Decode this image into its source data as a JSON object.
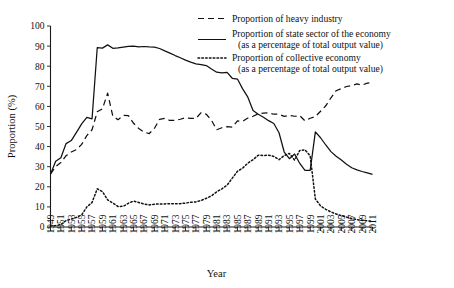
{
  "chart_data": {
    "type": "line",
    "title": "",
    "xlabel": "Year",
    "ylabel": "Proportion (%)",
    "xlim": [
      1949,
      2011
    ],
    "ylim": [
      0,
      100
    ],
    "grid": false,
    "legend_position": "top-right",
    "y_ticks": [
      0,
      10,
      20,
      30,
      40,
      50,
      60,
      70,
      80,
      90,
      100
    ],
    "x_ticks": [
      1949,
      1951,
      1953,
      1955,
      1957,
      1959,
      1961,
      1963,
      1965,
      1967,
      1969,
      1971,
      1973,
      1975,
      1977,
      1979,
      1981,
      1983,
      1985,
      1987,
      1989,
      1991,
      1993,
      1995,
      1997,
      1999,
      2001,
      2003,
      2005,
      2007,
      2009,
      2011
    ],
    "x": [
      1949,
      1950,
      1951,
      1952,
      1953,
      1954,
      1955,
      1956,
      1957,
      1958,
      1959,
      1960,
      1961,
      1962,
      1963,
      1964,
      1965,
      1966,
      1967,
      1968,
      1969,
      1970,
      1971,
      1972,
      1973,
      1974,
      1975,
      1976,
      1977,
      1978,
      1979,
      1980,
      1981,
      1982,
      1983,
      1984,
      1985,
      1986,
      1987,
      1988,
      1989,
      1990,
      1991,
      1992,
      1993,
      1994,
      1995,
      1996,
      1997,
      1998,
      1999,
      2000,
      2001,
      2002,
      2003,
      2004,
      2005,
      2006,
      2007,
      2008,
      2009,
      2010,
      2011
    ],
    "series": [
      {
        "name": "Proportion of heavy industry",
        "style": "dashed",
        "values": [
          26.4,
          30.1,
          32.1,
          35.5,
          37.3,
          38.5,
          41.1,
          45.5,
          48.4,
          57.3,
          58.8,
          66.6,
          55.1,
          53.4,
          55.5,
          55.4,
          51.6,
          49.0,
          47.2,
          46.5,
          49.0,
          53.6,
          54.0,
          53.0,
          53.1,
          53.6,
          54.4,
          54.0,
          54.0,
          56.9,
          56.1,
          53.1,
          48.4,
          49.4,
          49.9,
          49.7,
          52.8,
          52.6,
          54.2,
          55.1,
          56.3,
          56.6,
          56.8,
          56.1,
          56.1,
          55.0,
          55.5,
          55.1,
          55.4,
          52.8,
          54.1,
          54.9,
          57.6,
          60.3,
          64.3,
          67.8,
          68.9,
          69.9,
          70.4,
          71.2,
          70.6,
          71.6,
          71.8
        ]
      },
      {
        "name": "Proportion of state sector of the economy (as a percentage of total output value)",
        "style": "solid",
        "values": [
          26.2,
          32.7,
          34.5,
          41.5,
          43.0,
          47.1,
          51.3,
          54.5,
          53.8,
          89.2,
          89.0,
          90.6,
          88.9,
          89.1,
          89.5,
          89.9,
          90.0,
          89.6,
          89.8,
          89.6,
          89.5,
          88.8,
          87.6,
          86.5,
          85.3,
          84.2,
          83.0,
          82.0,
          81.2,
          80.8,
          80.3,
          78.6,
          77.0,
          76.7,
          76.9,
          74.0,
          73.6,
          68.7,
          64.6,
          58.0,
          56.1,
          54.6,
          52.9,
          51.5,
          46.9,
          37.3,
          34.0,
          36.3,
          31.6,
          28.2,
          28.2,
          47.3,
          44.4,
          40.8,
          37.5,
          35.2,
          33.3,
          31.2,
          29.5,
          28.4,
          27.6,
          26.9,
          26.2
        ]
      },
      {
        "name": "Proportion of collective economy (as a percentage of total output value)",
        "style": "dotted",
        "values": [
          0.5,
          0.7,
          1.2,
          3.2,
          3.9,
          4.8,
          6.0,
          10.0,
          12.2,
          19.0,
          17.6,
          13.5,
          11.9,
          10.2,
          10.3,
          11.8,
          12.9,
          12.2,
          11.4,
          11.0,
          11.3,
          11.5,
          11.5,
          11.6,
          11.6,
          11.6,
          11.9,
          12.3,
          12.5,
          13.2,
          14.3,
          15.5,
          17.5,
          19.0,
          20.8,
          24.3,
          27.7,
          29.3,
          31.8,
          33.5,
          35.7,
          35.6,
          35.7,
          35.1,
          33.5,
          35.5,
          36.6,
          33.3,
          38.1,
          38.4,
          35.4,
          13.9,
          10.5,
          8.8,
          7.5,
          6.5,
          5.6,
          4.9,
          4.2,
          3.7,
          3.3,
          3.1,
          2.9
        ]
      }
    ],
    "legend": [
      {
        "label": "Proportion of heavy industry",
        "label2": "",
        "style": "dashed"
      },
      {
        "label": "Proportion of state sector of the economy",
        "label2": "(as a percentage of total output value)",
        "style": "solid"
      },
      {
        "label": "Proportion of collective economy",
        "label2": "(as a percentage of total output value)",
        "style": "dotted"
      }
    ]
  }
}
